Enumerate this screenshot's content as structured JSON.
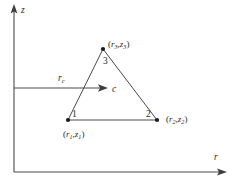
{
  "figure": {
    "kind": "axisymmetric-triangular-element-diagram",
    "background_color": "#ffffff",
    "line_color": "#4a4a4a",
    "text_color": "#2b2b2b",
    "axes": {
      "vertical_label": "z",
      "horizontal_label": "r",
      "origin": {
        "x": 14,
        "y": 172
      },
      "vertical_tip": {
        "x": 14,
        "y": 5
      },
      "horizontal_tip": {
        "x": 226,
        "y": 172
      }
    },
    "centroid_arrow": {
      "radius_label": "r",
      "radius_sub": "c",
      "tip_label": "c",
      "from": {
        "x": 14,
        "y": 88
      },
      "to": {
        "x": 107,
        "y": 88
      }
    },
    "triangle": {
      "nodes": [
        {
          "number": "1",
          "coord_open": "(",
          "coord_r": "r",
          "coord_r_sub": "1",
          "coord_comma": ",",
          "coord_z": "z",
          "coord_z_sub": "1",
          "coord_close": ")",
          "x": 68,
          "y": 120
        },
        {
          "number": "2",
          "coord_open": "(",
          "coord_r": "r",
          "coord_r_sub": "2",
          "coord_comma": ",",
          "coord_z": "z",
          "coord_z_sub": "2",
          "coord_close": ")",
          "x": 157,
          "y": 120
        },
        {
          "number": "3",
          "coord_open": "(",
          "coord_r": "r",
          "coord_r_sub": "3",
          "coord_comma": ",",
          "coord_z": "z",
          "coord_z_sub": "3",
          "coord_close": ")",
          "x": 103,
          "y": 49
        }
      ]
    }
  }
}
